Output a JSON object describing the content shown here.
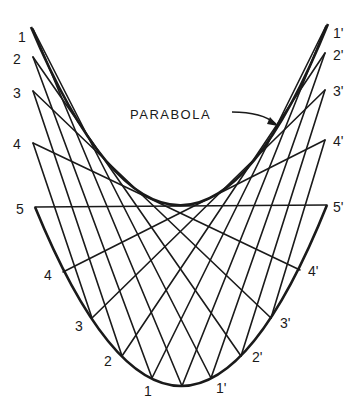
{
  "diagram": {
    "title_label": "PARABOLA",
    "colors": {
      "ink": "#1a1a1a",
      "background": "#ffffff"
    },
    "left_points": [
      {
        "label": "1",
        "x": 33,
        "y": 29
      },
      {
        "label": "2",
        "x": 33,
        "y": 57
      },
      {
        "label": "3",
        "x": 33,
        "y": 91
      },
      {
        "label": "4",
        "x": 33,
        "y": 143
      },
      {
        "label": "5",
        "x": 35,
        "y": 207
      }
    ],
    "right_points": [
      {
        "label": "1'",
        "x": 326,
        "y": 26
      },
      {
        "label": "2'",
        "x": 325,
        "y": 53
      },
      {
        "label": "3'",
        "x": 325,
        "y": 90
      },
      {
        "label": "4'",
        "x": 325,
        "y": 140
      },
      {
        "label": "5'",
        "x": 327,
        "y": 205
      }
    ],
    "lower_curve_left": [
      {
        "label": "4",
        "x": 63,
        "y": 272
      },
      {
        "label": "3",
        "x": 92,
        "y": 318
      },
      {
        "label": "2",
        "x": 122,
        "y": 356
      },
      {
        "label": "1",
        "x": 152,
        "y": 378
      }
    ],
    "lower_curve_right": [
      {
        "label": "4'",
        "x": 300,
        "y": 270
      },
      {
        "label": "3'",
        "x": 271,
        "y": 318
      },
      {
        "label": "2'",
        "x": 241,
        "y": 356
      },
      {
        "label": "1'",
        "x": 211,
        "y": 378
      }
    ],
    "lower_vertex": {
      "x": 182,
      "y": 386
    },
    "upper_envelope_vertex": {
      "x": 182,
      "y": 205
    }
  }
}
